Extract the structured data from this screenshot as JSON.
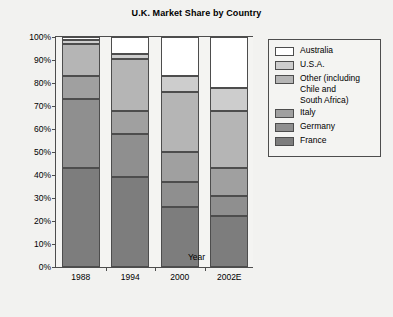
{
  "chart_data": {
    "type": "bar",
    "stacked": true,
    "title": "U.K. Market Share by Country",
    "xlabel": "Year",
    "ylabel": "Market Share",
    "categories": [
      "1988",
      "1994",
      "2000",
      "2002E"
    ],
    "ylim": [
      0,
      100
    ],
    "ytick_labels": [
      "0%",
      "10%",
      "20%",
      "30%",
      "40%",
      "50%",
      "60%",
      "70%",
      "80%",
      "90%",
      "100%"
    ],
    "ytick_values": [
      0,
      10,
      20,
      30,
      40,
      50,
      60,
      70,
      80,
      90,
      100
    ],
    "grid": false,
    "legend_position": "right",
    "series": [
      {
        "name": "France",
        "color": "#7d7d7d",
        "values": [
          43,
          39,
          26,
          22
        ]
      },
      {
        "name": "Germany",
        "color": "#8f8f8f",
        "values": [
          30,
          19,
          11,
          9
        ]
      },
      {
        "name": "Italy",
        "color": "#a0a0a0",
        "values": [
          10,
          10,
          13,
          12
        ]
      },
      {
        "name": "Other (including Chile and South Africa)",
        "color": "#b5b5b5",
        "values": [
          14,
          22.5,
          26,
          25
        ]
      },
      {
        "name": "U.S.A.",
        "color": "#cdcdcd",
        "values": [
          1.5,
          2,
          7,
          10
        ]
      },
      {
        "name": "Australia",
        "color": "#ffffff",
        "values": [
          1.5,
          7.5,
          17,
          22
        ]
      }
    ]
  },
  "legend": {
    "items": [
      {
        "label": "Australia",
        "color": "#ffffff"
      },
      {
        "label": "U.S.A.",
        "color": "#cdcdcd"
      },
      {
        "label": "Other (including",
        "label2": "Chile and",
        "label3": "South Africa)",
        "color": "#b5b5b5"
      },
      {
        "label": "Italy",
        "color": "#a0a0a0"
      },
      {
        "label": "Germany",
        "color": "#8f8f8f"
      },
      {
        "label": "France",
        "color": "#7d7d7d"
      }
    ]
  },
  "colors": {
    "axis": "#4d4d4d",
    "background": "#f2f2f0",
    "plot_background": "#f4f4f2"
  }
}
